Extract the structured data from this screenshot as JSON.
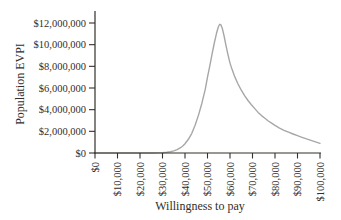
{
  "chart_data": {
    "type": "line",
    "xlabel": "Willingness to pay",
    "ylabel": "Population EVPI",
    "xlim": [
      0,
      100000
    ],
    "ylim": [
      0,
      12000000
    ],
    "grid": false,
    "legend_position": "none",
    "axis_color": "#33302b",
    "text_color": "#332e29",
    "x_ticks": {
      "values": [
        0,
        10000,
        20000,
        30000,
        40000,
        50000,
        60000,
        70000,
        80000,
        90000,
        100000
      ],
      "labels": [
        "$0",
        "$10,000",
        "$20,000",
        "$30,000",
        "$40,000",
        "$50,000",
        "$60,000",
        "$70,000",
        "$80,000",
        "$90,000",
        "$100,000"
      ]
    },
    "y_ticks": {
      "values": [
        0,
        2000000,
        4000000,
        6000000,
        8000000,
        10000000,
        12000000
      ],
      "labels": [
        "$0",
        "$2,000,000",
        "$4,000,000",
        "$6,000,000",
        "$8,000,000",
        "$10,000,000",
        "$12,000,000"
      ]
    },
    "series": [
      {
        "name": "Population EVPI",
        "color": "#a7a7a7",
        "peak": {
          "x": 55400,
          "y": 11880000
        },
        "points": [
          [
            0,
            0
          ],
          [
            10000,
            0
          ],
          [
            20000,
            0
          ],
          [
            26000,
            0
          ],
          [
            28000,
            10000
          ],
          [
            30000,
            30000
          ],
          [
            32000,
            70000
          ],
          [
            33500,
            120000
          ],
          [
            35000,
            190000
          ],
          [
            36500,
            310000
          ],
          [
            38000,
            490000
          ],
          [
            39000,
            650000
          ],
          [
            40000,
            860000
          ],
          [
            41500,
            1260000
          ],
          [
            43000,
            1820000
          ],
          [
            44500,
            2560000
          ],
          [
            46000,
            3500000
          ],
          [
            47500,
            4600000
          ],
          [
            49000,
            5900000
          ],
          [
            50000,
            7000000
          ],
          [
            51000,
            8050000
          ],
          [
            52000,
            9100000
          ],
          [
            53000,
            10150000
          ],
          [
            54000,
            11050000
          ],
          [
            54800,
            11630000
          ],
          [
            55400,
            11880000
          ],
          [
            56000,
            11820000
          ],
          [
            56600,
            11500000
          ],
          [
            57400,
            10800000
          ],
          [
            58200,
            9950000
          ],
          [
            59000,
            9150000
          ],
          [
            60000,
            8300000
          ],
          [
            61000,
            7650000
          ],
          [
            62000,
            7100000
          ],
          [
            63500,
            6400000
          ],
          [
            65000,
            5800000
          ],
          [
            66500,
            5300000
          ],
          [
            68000,
            4850000
          ],
          [
            69500,
            4450000
          ],
          [
            71000,
            4100000
          ],
          [
            72500,
            3750000
          ],
          [
            74000,
            3450000
          ],
          [
            75500,
            3200000
          ],
          [
            77000,
            2950000
          ],
          [
            78500,
            2750000
          ],
          [
            80000,
            2550000
          ],
          [
            82000,
            2300000
          ],
          [
            84000,
            2100000
          ],
          [
            86000,
            1920000
          ],
          [
            88000,
            1750000
          ],
          [
            90000,
            1600000
          ],
          [
            92000,
            1450000
          ],
          [
            94000,
            1300000
          ],
          [
            96000,
            1170000
          ],
          [
            98000,
            1030000
          ],
          [
            100000,
            900000
          ]
        ]
      }
    ]
  }
}
